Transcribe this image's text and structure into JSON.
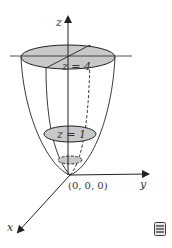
{
  "figure": {
    "axes": {
      "z_label": "z",
      "y_label": "y",
      "x_label": "x",
      "origin_label": "(0, 0, 0)"
    },
    "level_curves": [
      {
        "label": "z = 4"
      },
      {
        "label": "z = 1"
      }
    ],
    "colors": {
      "disk_fill": "#c8c8c8",
      "line": "#222222"
    }
  },
  "icons": {
    "menu": "menu-icon"
  }
}
